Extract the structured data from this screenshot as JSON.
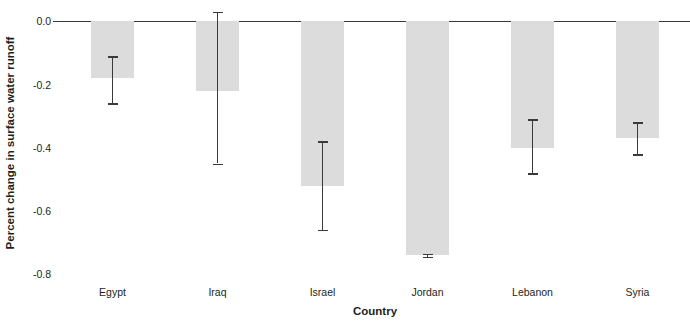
{
  "chart_data": {
    "type": "bar",
    "title": "",
    "xlabel": "Country",
    "ylabel": "Percent change in surface water runoff",
    "categories": [
      "Egypt",
      "Iraq",
      "Israel",
      "Jordan",
      "Lebanon",
      "Syria"
    ],
    "values": [
      -0.18,
      -0.22,
      -0.52,
      -0.74,
      -0.4,
      -0.37
    ],
    "error_high": [
      -0.11,
      0.03,
      -0.38,
      -0.735,
      -0.31,
      -0.32
    ],
    "error_low": [
      -0.26,
      -0.45,
      -0.66,
      -0.745,
      -0.48,
      -0.42
    ],
    "ylim": [
      -0.8,
      0.0
    ],
    "yticks": [
      0.0,
      -0.2,
      -0.4,
      -0.6,
      -0.8
    ],
    "ytick_labels": [
      "0.0",
      "-0.2",
      "-0.4",
      "-0.6",
      "-0.8"
    ],
    "grid": false,
    "legend": "none",
    "bar_color": "#dcdcdc",
    "error_color": "#3a3a3a",
    "axis_color": "#3a3a3a"
  },
  "axes": {
    "y_title": "Percent change in surface water runoff",
    "x_title": "Country"
  },
  "title_remnant": ""
}
